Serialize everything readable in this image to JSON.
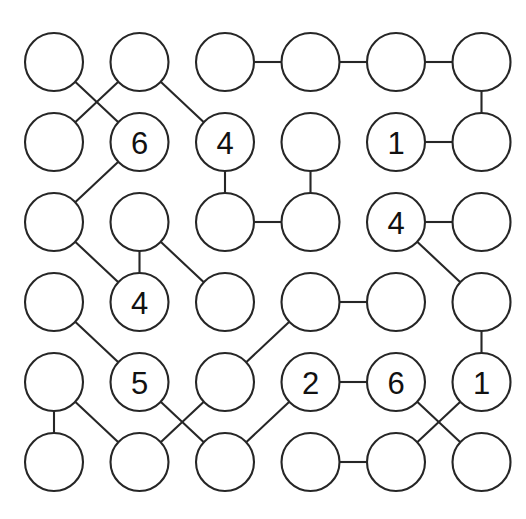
{
  "page": {
    "width": 526,
    "height": 519,
    "background_color": "#ffffff",
    "stroke_color": "#262626",
    "text_color": "#111111"
  },
  "grid": {
    "rows": 6,
    "cols": 6,
    "origin_x": 54,
    "origin_y": 62,
    "step_x": 85.5,
    "step_y": 80.0,
    "radius": 29
  },
  "nodes": [
    {
      "id": "r0c0",
      "row": 0,
      "col": 0,
      "label": ""
    },
    {
      "id": "r0c1",
      "row": 0,
      "col": 1,
      "label": ""
    },
    {
      "id": "r0c2",
      "row": 0,
      "col": 2,
      "label": ""
    },
    {
      "id": "r0c3",
      "row": 0,
      "col": 3,
      "label": ""
    },
    {
      "id": "r0c4",
      "row": 0,
      "col": 4,
      "label": ""
    },
    {
      "id": "r0c5",
      "row": 0,
      "col": 5,
      "label": ""
    },
    {
      "id": "r1c0",
      "row": 1,
      "col": 0,
      "label": ""
    },
    {
      "id": "r1c1",
      "row": 1,
      "col": 1,
      "label": "6"
    },
    {
      "id": "r1c2",
      "row": 1,
      "col": 2,
      "label": "4"
    },
    {
      "id": "r1c3",
      "row": 1,
      "col": 3,
      "label": ""
    },
    {
      "id": "r1c4",
      "row": 1,
      "col": 4,
      "label": "1"
    },
    {
      "id": "r1c5",
      "row": 1,
      "col": 5,
      "label": ""
    },
    {
      "id": "r2c0",
      "row": 2,
      "col": 0,
      "label": ""
    },
    {
      "id": "r2c1",
      "row": 2,
      "col": 1,
      "label": ""
    },
    {
      "id": "r2c2",
      "row": 2,
      "col": 2,
      "label": ""
    },
    {
      "id": "r2c3",
      "row": 2,
      "col": 3,
      "label": ""
    },
    {
      "id": "r2c4",
      "row": 2,
      "col": 4,
      "label": "4"
    },
    {
      "id": "r2c5",
      "row": 2,
      "col": 5,
      "label": ""
    },
    {
      "id": "r3c0",
      "row": 3,
      "col": 0,
      "label": ""
    },
    {
      "id": "r3c1",
      "row": 3,
      "col": 1,
      "label": "4"
    },
    {
      "id": "r3c2",
      "row": 3,
      "col": 2,
      "label": ""
    },
    {
      "id": "r3c3",
      "row": 3,
      "col": 3,
      "label": ""
    },
    {
      "id": "r3c4",
      "row": 3,
      "col": 4,
      "label": ""
    },
    {
      "id": "r3c5",
      "row": 3,
      "col": 5,
      "label": ""
    },
    {
      "id": "r4c0",
      "row": 4,
      "col": 0,
      "label": ""
    },
    {
      "id": "r4c1",
      "row": 4,
      "col": 1,
      "label": "5"
    },
    {
      "id": "r4c2",
      "row": 4,
      "col": 2,
      "label": ""
    },
    {
      "id": "r4c3",
      "row": 4,
      "col": 3,
      "label": "2"
    },
    {
      "id": "r4c4",
      "row": 4,
      "col": 4,
      "label": "6"
    },
    {
      "id": "r4c5",
      "row": 4,
      "col": 5,
      "label": "1"
    },
    {
      "id": "r5c0",
      "row": 5,
      "col": 0,
      "label": ""
    },
    {
      "id": "r5c1",
      "row": 5,
      "col": 1,
      "label": ""
    },
    {
      "id": "r5c2",
      "row": 5,
      "col": 2,
      "label": ""
    },
    {
      "id": "r5c3",
      "row": 5,
      "col": 3,
      "label": ""
    },
    {
      "id": "r5c4",
      "row": 5,
      "col": 4,
      "label": ""
    },
    {
      "id": "r5c5",
      "row": 5,
      "col": 5,
      "label": ""
    }
  ],
  "edges": [
    {
      "from": "r0c2",
      "to": "r0c3",
      "kind": "horizontal"
    },
    {
      "from": "r0c3",
      "to": "r0c4",
      "kind": "horizontal"
    },
    {
      "from": "r0c4",
      "to": "r0c5",
      "kind": "horizontal"
    },
    {
      "from": "r0c0",
      "to": "r1c1",
      "kind": "diagonal-down-right"
    },
    {
      "from": "r0c1",
      "to": "r1c0",
      "kind": "diagonal-down-left"
    },
    {
      "from": "r0c1",
      "to": "r1c2",
      "kind": "diagonal-down-right"
    },
    {
      "from": "r0c5",
      "to": "r1c5",
      "kind": "vertical"
    },
    {
      "from": "r1c4",
      "to": "r1c5",
      "kind": "horizontal"
    },
    {
      "from": "r1c1",
      "to": "r2c0",
      "kind": "diagonal-down-left"
    },
    {
      "from": "r1c2",
      "to": "r2c2",
      "kind": "vertical"
    },
    {
      "from": "r1c3",
      "to": "r2c3",
      "kind": "vertical"
    },
    {
      "from": "r2c2",
      "to": "r2c3",
      "kind": "horizontal"
    },
    {
      "from": "r2c4",
      "to": "r2c5",
      "kind": "horizontal"
    },
    {
      "from": "r2c0",
      "to": "r3c1",
      "kind": "diagonal-down-right"
    },
    {
      "from": "r2c1",
      "to": "r3c1",
      "kind": "vertical"
    },
    {
      "from": "r2c1",
      "to": "r3c2",
      "kind": "diagonal-down-right"
    },
    {
      "from": "r2c4",
      "to": "r3c5",
      "kind": "diagonal-down-right"
    },
    {
      "from": "r3c3",
      "to": "r3c4",
      "kind": "horizontal"
    },
    {
      "from": "r3c0",
      "to": "r4c1",
      "kind": "diagonal-down-right"
    },
    {
      "from": "r3c3",
      "to": "r4c2",
      "kind": "diagonal-down-left"
    },
    {
      "from": "r3c5",
      "to": "r4c5",
      "kind": "vertical"
    },
    {
      "from": "r4c3",
      "to": "r4c4",
      "kind": "horizontal"
    },
    {
      "from": "r4c0",
      "to": "r5c0",
      "kind": "vertical"
    },
    {
      "from": "r4c0",
      "to": "r5c1",
      "kind": "diagonal-down-right"
    },
    {
      "from": "r4c1",
      "to": "r5c2",
      "kind": "diagonal-down-right"
    },
    {
      "from": "r4c2",
      "to": "r5c1",
      "kind": "diagonal-down-left"
    },
    {
      "from": "r4c3",
      "to": "r5c2",
      "kind": "diagonal-down-left"
    },
    {
      "from": "r4c4",
      "to": "r5c5",
      "kind": "diagonal-down-right"
    },
    {
      "from": "r4c5",
      "to": "r5c4",
      "kind": "diagonal-down-left"
    },
    {
      "from": "r5c3",
      "to": "r5c4",
      "kind": "horizontal"
    }
  ]
}
